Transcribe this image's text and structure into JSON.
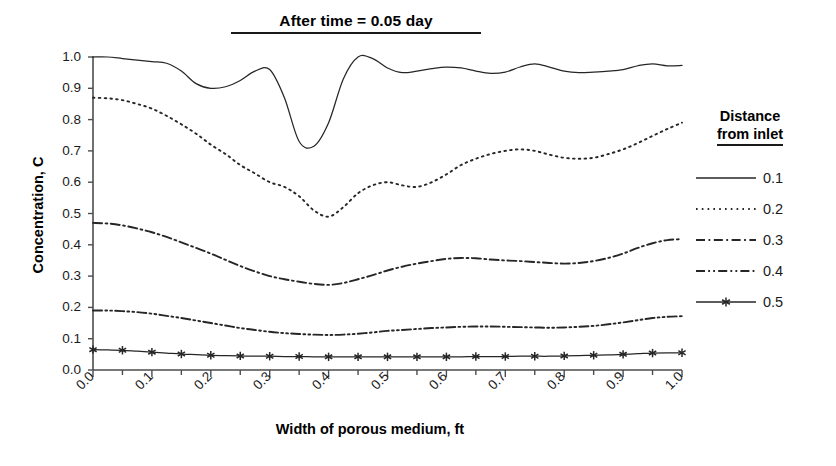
{
  "chart_data": {
    "type": "line",
    "title": "After time = 0.05 day",
    "subtitle": "",
    "xlabel": "Width of porous medium, ft",
    "ylabel": "Concentration, C",
    "xlim": [
      0.0,
      1.0
    ],
    "ylim": [
      0.0,
      1.0
    ],
    "grid": false,
    "legend_position": "right",
    "legend_title": "Distance from inlet",
    "xticks": [
      "0.0",
      "0.1",
      "0.2",
      "0.3",
      "0.4",
      "0.5",
      "0.6",
      "0.7",
      "0.8",
      "0.9",
      "1.0"
    ],
    "xtick_values": [
      0.0,
      0.1,
      0.2,
      0.3,
      0.4,
      0.5,
      0.6,
      0.7,
      0.8,
      0.9,
      1.0
    ],
    "minor_xtick_interval": 0.05,
    "yticks": [
      "0.0",
      "0.1",
      "0.2",
      "0.3",
      "0.4",
      "0.5",
      "0.6",
      "0.7",
      "0.8",
      "0.9",
      "1.0"
    ],
    "ytick_values": [
      0.0,
      0.1,
      0.2,
      0.3,
      0.4,
      0.5,
      0.6,
      0.7,
      0.8,
      0.9,
      1.0
    ],
    "x": [
      0.0,
      0.025,
      0.05,
      0.075,
      0.1,
      0.125,
      0.15,
      0.175,
      0.2,
      0.225,
      0.25,
      0.275,
      0.3,
      0.325,
      0.35,
      0.375,
      0.4,
      0.425,
      0.45,
      0.475,
      0.5,
      0.525,
      0.55,
      0.575,
      0.6,
      0.625,
      0.65,
      0.675,
      0.7,
      0.725,
      0.75,
      0.775,
      0.8,
      0.825,
      0.85,
      0.875,
      0.9,
      0.925,
      0.95,
      0.975,
      1.0
    ],
    "series": [
      {
        "name": "0.1",
        "style": "solid",
        "marker": "none",
        "color": "#262626",
        "values": [
          1.0,
          1.0,
          0.995,
          0.99,
          0.985,
          0.98,
          0.955,
          0.915,
          0.9,
          0.905,
          0.925,
          0.955,
          0.96,
          0.87,
          0.73,
          0.715,
          0.79,
          0.93,
          1.0,
          0.995,
          0.965,
          0.95,
          0.955,
          0.963,
          0.968,
          0.965,
          0.955,
          0.948,
          0.952,
          0.968,
          0.978,
          0.968,
          0.955,
          0.95,
          0.952,
          0.955,
          0.96,
          0.972,
          0.978,
          0.972,
          0.973
        ]
      },
      {
        "name": "0.2",
        "style": "dotted",
        "marker": "none",
        "color": "#262626",
        "values": [
          0.87,
          0.868,
          0.862,
          0.85,
          0.835,
          0.812,
          0.785,
          0.755,
          0.72,
          0.69,
          0.655,
          0.628,
          0.6,
          0.585,
          0.555,
          0.51,
          0.49,
          0.52,
          0.565,
          0.59,
          0.6,
          0.59,
          0.585,
          0.6,
          0.625,
          0.655,
          0.675,
          0.69,
          0.7,
          0.705,
          0.7,
          0.688,
          0.678,
          0.675,
          0.678,
          0.69,
          0.705,
          0.725,
          0.748,
          0.77,
          0.79
        ]
      },
      {
        "name": "0.3",
        "style": "dashdot",
        "marker": "none",
        "color": "#262626",
        "values": [
          0.47,
          0.468,
          0.462,
          0.452,
          0.44,
          0.425,
          0.408,
          0.39,
          0.372,
          0.352,
          0.332,
          0.315,
          0.3,
          0.29,
          0.282,
          0.275,
          0.272,
          0.278,
          0.29,
          0.303,
          0.318,
          0.33,
          0.34,
          0.348,
          0.355,
          0.358,
          0.357,
          0.353,
          0.35,
          0.348,
          0.345,
          0.342,
          0.34,
          0.342,
          0.348,
          0.358,
          0.372,
          0.39,
          0.405,
          0.415,
          0.418
        ]
      },
      {
        "name": "0.4",
        "style": "dashdotdot",
        "marker": "none",
        "color": "#262626",
        "values": [
          0.19,
          0.19,
          0.188,
          0.185,
          0.18,
          0.173,
          0.166,
          0.158,
          0.15,
          0.142,
          0.134,
          0.128,
          0.122,
          0.118,
          0.115,
          0.113,
          0.112,
          0.113,
          0.116,
          0.12,
          0.125,
          0.128,
          0.131,
          0.134,
          0.136,
          0.138,
          0.139,
          0.139,
          0.138,
          0.137,
          0.136,
          0.135,
          0.136,
          0.138,
          0.141,
          0.146,
          0.152,
          0.159,
          0.166,
          0.17,
          0.172
        ]
      },
      {
        "name": "0.5",
        "style": "solid",
        "marker": "star",
        "marker_interval": 0.05,
        "color": "#262626",
        "values": [
          0.065,
          0.064,
          0.063,
          0.06,
          0.057,
          0.054,
          0.051,
          0.049,
          0.047,
          0.046,
          0.045,
          0.044,
          0.044,
          0.043,
          0.043,
          0.042,
          0.042,
          0.042,
          0.042,
          0.042,
          0.042,
          0.042,
          0.042,
          0.042,
          0.042,
          0.042,
          0.043,
          0.043,
          0.043,
          0.044,
          0.044,
          0.044,
          0.045,
          0.046,
          0.047,
          0.048,
          0.05,
          0.052,
          0.054,
          0.055,
          0.055
        ]
      }
    ]
  },
  "legend": {
    "title_line1": "Distance",
    "title_line2": "from inlet",
    "items": [
      {
        "label": "0.1",
        "style": "solid"
      },
      {
        "label": "0.2",
        "style": "dotted"
      },
      {
        "label": "0.3",
        "style": "dashdot"
      },
      {
        "label": "0.4",
        "style": "dashdotdot"
      },
      {
        "label": "0.5",
        "style": "solid-star"
      }
    ]
  },
  "axes": {
    "line_color": "#4d4d4d",
    "text_color": "#1a1a1a"
  }
}
